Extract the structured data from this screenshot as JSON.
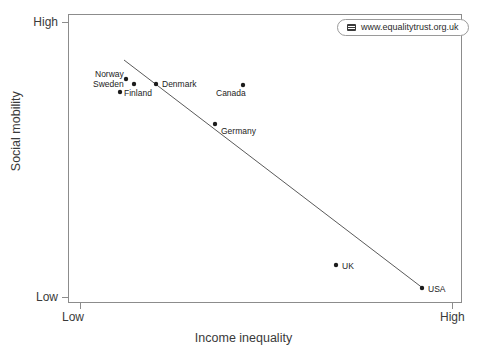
{
  "chart_data": {
    "type": "scatter",
    "title": "",
    "xlabel": "Income inequality",
    "ylabel": "Social mobility",
    "x_ticks": [
      "Low",
      "High"
    ],
    "y_ticks": [
      "High",
      "Low"
    ],
    "xlim": [
      "Low",
      "High"
    ],
    "ylim": [
      "Low",
      "High"
    ],
    "grid": false,
    "legend_position": "top-right",
    "annotation": "Countries with higher income inequality have lower social mobility",
    "trendline": {
      "present": true,
      "direction": "negative",
      "x_start_px": 124,
      "y_start_px": 60,
      "x_end_px": 424,
      "y_end_px": 289
    },
    "points": [
      {
        "label": "Norway",
        "x_px": 126,
        "y_px": 79,
        "label_x_px": 95,
        "label_y_px": 70,
        "x_rel": 0.147,
        "y_rel": 0.775
      },
      {
        "label": "Sweden",
        "x_px": 134,
        "y_px": 84,
        "label_x_px": 93,
        "label_y_px": 80,
        "x_rel": 0.168,
        "y_rel": 0.758
      },
      {
        "label": "Finland",
        "x_px": 120,
        "y_px": 92,
        "label_x_px": 124,
        "label_y_px": 89,
        "x_rel": 0.132,
        "y_rel": 0.73
      },
      {
        "label": "Denmark",
        "x_px": 156,
        "y_px": 84,
        "label_x_px": 162,
        "label_y_px": 80,
        "x_rel": 0.223,
        "y_rel": 0.758
      },
      {
        "label": "Canada",
        "x_px": 243,
        "y_px": 85,
        "label_x_px": 216,
        "label_y_px": 89,
        "x_rel": 0.444,
        "y_rel": 0.754
      },
      {
        "label": "Germany",
        "x_px": 215,
        "y_px": 124,
        "label_x_px": 221,
        "label_y_px": 127,
        "x_rel": 0.373,
        "y_rel": 0.619
      },
      {
        "label": "UK",
        "x_px": 336,
        "y_px": 265,
        "label_x_px": 342,
        "label_y_px": 262,
        "x_rel": 0.68,
        "y_rel": 0.131
      },
      {
        "label": "USA",
        "x_px": 422,
        "y_px": 288,
        "label_x_px": 428,
        "label_y_px": 285,
        "x_rel": 0.898,
        "y_rel": 0.052
      }
    ],
    "colors": {
      "point": "#1c1c1c",
      "trendline": "#5a5a5a",
      "frame": "#8c8c8c",
      "text": "#3a3a3a"
    }
  },
  "legend": {
    "icon": "card-icon",
    "url": "www.equalitytrust.org.uk"
  }
}
